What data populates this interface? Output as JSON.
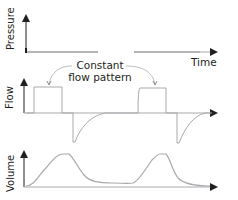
{
  "diagram": {
    "annotation": {
      "line1": "Constant",
      "line2": "flow pattern"
    },
    "x_axis_label": "Time",
    "panels": [
      {
        "name": "pressure",
        "ylabel": "Pressure"
      },
      {
        "name": "flow",
        "ylabel": "Flow"
      },
      {
        "name": "volume",
        "ylabel": "Volume"
      }
    ],
    "colors": {
      "axis": "#231f20",
      "trace": "#a7a9ac",
      "text": "#231f20"
    }
  }
}
